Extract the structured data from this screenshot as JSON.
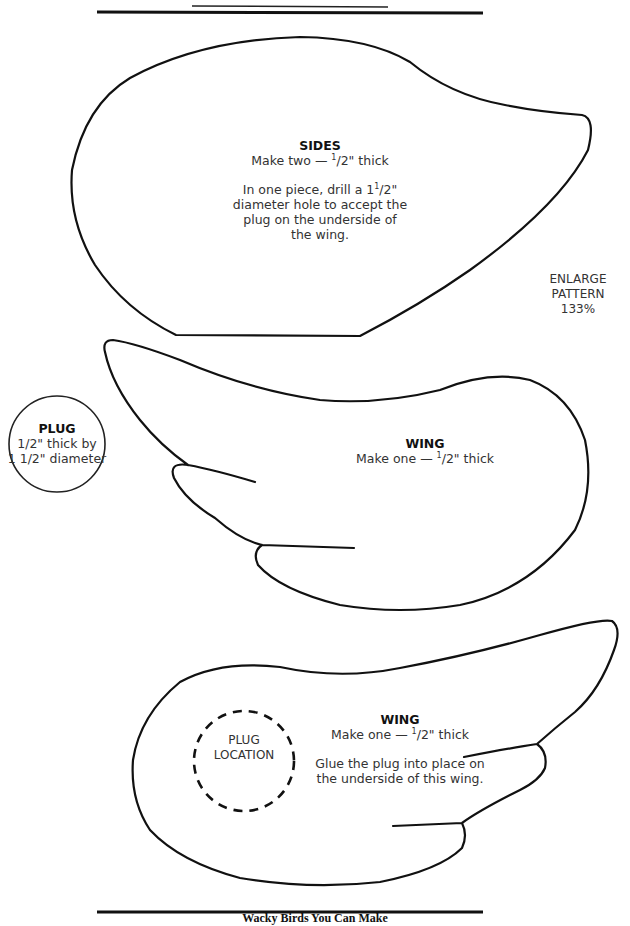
{
  "page": {
    "footer_text": "Wacky Birds You Can Make"
  },
  "sides": {
    "title": "SIDES",
    "subtitle_pre": "Make two — ",
    "subtitle_frac_num": "1",
    "subtitle_frac_rest": "/2\" thick",
    "instructions_line1_pre": "In one piece, drill a 1",
    "instructions_line1_num": "1",
    "instructions_line1_rest": "/2\"",
    "instructions_line2": "diameter hole to accept the",
    "instructions_line3": "plug on the underside of",
    "instructions_line4": "the wing."
  },
  "enlarge_note": {
    "line1": "ENLARGE",
    "line2": "PATTERN",
    "line3": "133%"
  },
  "plug": {
    "title": "PLUG",
    "line1": "1/2\" thick by",
    "line2": "1 1/2\" diameter"
  },
  "wing_top": {
    "title": "WING",
    "subtitle_pre": "Make one — ",
    "subtitle_frac_num": "1",
    "subtitle_frac_rest": "/2\" thick"
  },
  "wing_bottom": {
    "title": "WING",
    "subtitle_pre": "Make one — ",
    "subtitle_frac_num": "1",
    "subtitle_frac_rest": "/2\" thick",
    "instructions_line1": "Glue the plug into place on",
    "instructions_line2": "the underside of this wing.",
    "plug_location_line1": "PLUG",
    "plug_location_line2": "LOCATION"
  }
}
